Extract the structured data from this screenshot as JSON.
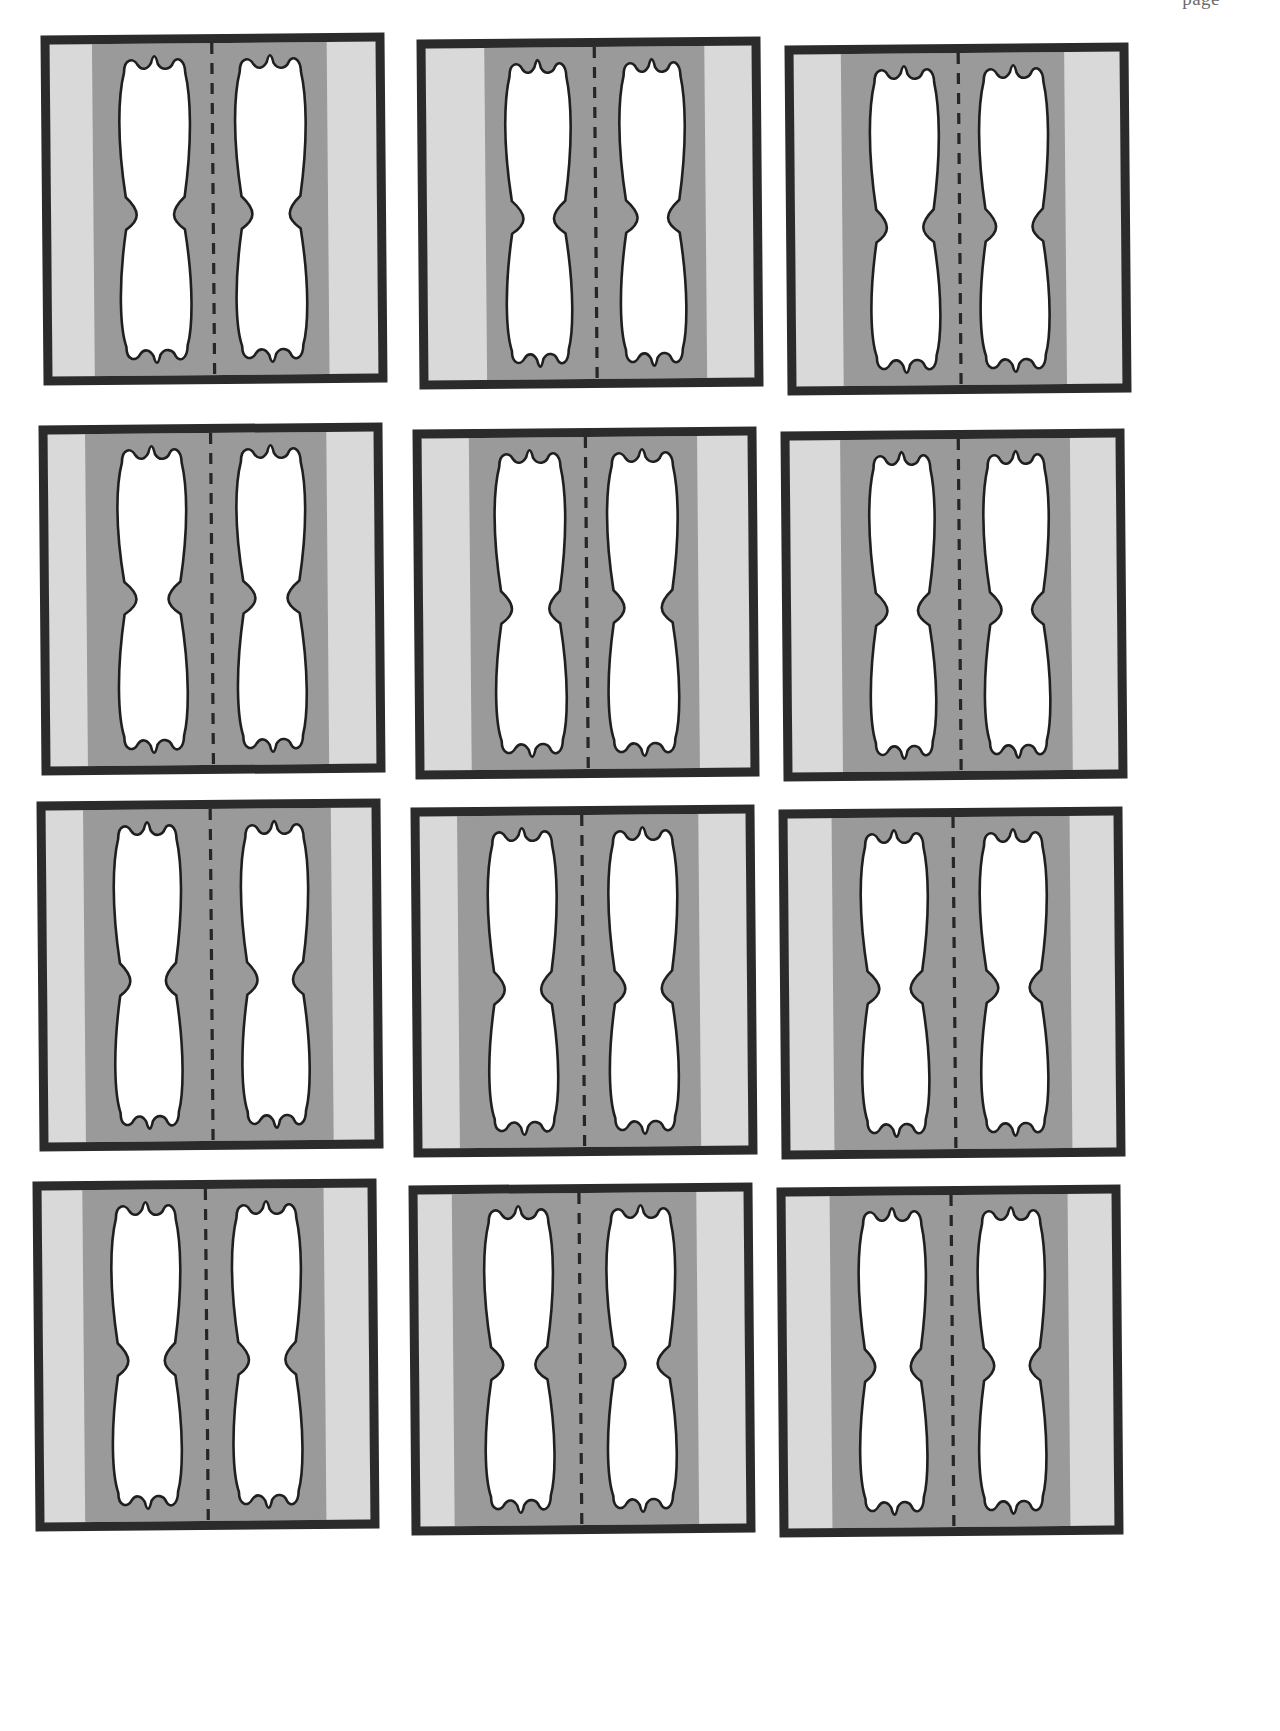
{
  "page": {
    "running_head": "page",
    "background_color": "#ffffff",
    "width": 1280,
    "height": 1731
  },
  "palette": {
    "border_dark": "#2b2b2b",
    "band_light_gray": "#d9d9d9",
    "band_mid_gray": "#9a9a9a",
    "shape_fill_white": "#ffffff",
    "shape_outline": "#1f1f1f",
    "centerline_dash": "#262626",
    "page_background": "#ffffff"
  },
  "figure_grid": {
    "label": "figure-grid",
    "columns": 3,
    "rows": 4,
    "count": 12,
    "cell_description": "rectangular frame with thick dark border, vertical gray bands and two white wavy shapes split by a dashed centerline",
    "cells": [
      {
        "index": 1,
        "name": "figure-cell-1",
        "row": 1,
        "column": 1,
        "x": 42,
        "y": 34,
        "rotation": -0.5,
        "left_light_band": 0.0,
        "left_light_band_end": 0.13,
        "right_light_band_start": 0.85,
        "shape_left_x": 0.215,
        "shape_right_x": 0.78,
        "shape_width": 0.21,
        "waist": 0.52,
        "waist_pinch": 0.035
      },
      {
        "index": 2,
        "name": "figure-cell-2",
        "row": 1,
        "column": 2,
        "x": 418,
        "y": 38,
        "rotation": -0.5,
        "left_light_band": 0.0,
        "left_light_band_end": 0.18,
        "right_light_band_start": 0.855,
        "shape_left_x": 0.245,
        "shape_right_x": 0.79,
        "shape_width": 0.195,
        "waist": 0.52,
        "waist_pinch": 0.04
      },
      {
        "index": 3,
        "name": "figure-cell-3",
        "row": 1,
        "column": 3,
        "x": 786,
        "y": 44,
        "rotation": -0.5,
        "left_light_band": 0.0,
        "left_light_band_end": 0.145,
        "right_light_band_start": 0.83,
        "shape_left_x": 0.235,
        "shape_right_x": 0.775,
        "shape_width": 0.205,
        "waist": 0.53,
        "waist_pinch": 0.035
      },
      {
        "index": 4,
        "name": "figure-cell-4",
        "row": 2,
        "column": 1,
        "x": 40,
        "y": 424,
        "rotation": -0.5,
        "left_light_band": 0.0,
        "left_light_band_end": 0.115,
        "right_light_band_start": 0.855,
        "shape_left_x": 0.215,
        "shape_right_x": 0.785,
        "shape_width": 0.205,
        "waist": 0.5,
        "waist_pinch": 0.04
      },
      {
        "index": 5,
        "name": "figure-cell-5",
        "row": 2,
        "column": 2,
        "x": 414,
        "y": 428,
        "rotation": -0.5,
        "left_light_band": 0.0,
        "left_light_band_end": 0.145,
        "right_light_band_start": 0.845,
        "shape_left_x": 0.225,
        "shape_right_x": 0.78,
        "shape_width": 0.21,
        "waist": 0.52,
        "waist_pinch": 0.035
      },
      {
        "index": 6,
        "name": "figure-cell-6",
        "row": 2,
        "column": 3,
        "x": 782,
        "y": 430,
        "rotation": -0.5,
        "left_light_band": 0.0,
        "left_light_band_end": 0.155,
        "right_light_band_start": 0.86,
        "shape_left_x": 0.245,
        "shape_right_x": 0.79,
        "shape_width": 0.195,
        "waist": 0.52,
        "waist_pinch": 0.04
      },
      {
        "index": 7,
        "name": "figure-cell-7",
        "row": 3,
        "column": 1,
        "x": 38,
        "y": 800,
        "rotation": -0.5,
        "left_light_band": 0.0,
        "left_light_band_end": 0.115,
        "right_light_band_start": 0.875,
        "shape_left_x": 0.21,
        "shape_right_x": 0.8,
        "shape_width": 0.2,
        "waist": 0.52,
        "waist_pinch": 0.035
      },
      {
        "index": 8,
        "name": "figure-cell-8",
        "row": 3,
        "column": 2,
        "x": 412,
        "y": 806,
        "rotation": -0.5,
        "left_light_band": 0.0,
        "left_light_band_end": 0.115,
        "right_light_band_start": 0.855,
        "shape_left_x": 0.21,
        "shape_right_x": 0.785,
        "shape_width": 0.205,
        "waist": 0.53,
        "waist_pinch": 0.035
      },
      {
        "index": 9,
        "name": "figure-cell-9",
        "row": 3,
        "column": 3,
        "x": 780,
        "y": 808,
        "rotation": -0.5,
        "left_light_band": 0.0,
        "left_light_band_end": 0.135,
        "right_light_band_start": 0.865,
        "shape_left_x": 0.225,
        "shape_right_x": 0.79,
        "shape_width": 0.2,
        "waist": 0.52,
        "waist_pinch": 0.04
      },
      {
        "index": 10,
        "name": "figure-cell-10",
        "row": 4,
        "column": 1,
        "x": 34,
        "y": 1180,
        "rotation": -0.5,
        "left_light_band": 0.0,
        "left_light_band_end": 0.125,
        "right_light_band_start": 0.865,
        "shape_left_x": 0.215,
        "shape_right_x": 0.79,
        "shape_width": 0.205,
        "waist": 0.52,
        "waist_pinch": 0.035
      },
      {
        "index": 11,
        "name": "figure-cell-11",
        "row": 4,
        "column": 2,
        "x": 410,
        "y": 1184,
        "rotation": -0.5,
        "left_light_band": 0.0,
        "left_light_band_end": 0.105,
        "right_light_band_start": 0.855,
        "shape_left_x": 0.205,
        "shape_right_x": 0.785,
        "shape_width": 0.205,
        "waist": 0.52,
        "waist_pinch": 0.04
      },
      {
        "index": 12,
        "name": "figure-cell-12",
        "row": 4,
        "column": 3,
        "x": 778,
        "y": 1186,
        "rotation": -0.5,
        "left_light_band": 0.0,
        "left_light_band_end": 0.135,
        "right_light_band_start": 0.865,
        "shape_left_x": 0.225,
        "shape_right_x": 0.79,
        "shape_width": 0.2,
        "waist": 0.52,
        "waist_pinch": 0.035
      }
    ]
  }
}
